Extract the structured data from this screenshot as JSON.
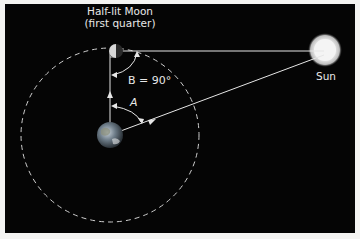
{
  "diagram": {
    "moon_label_line1": "Half-lit Moon",
    "moon_label_line2": "(first quarter)",
    "sun_label": "Sun",
    "angle_b_label": "B = 90°",
    "angle_a_label": "A",
    "colors": {
      "background": "#050505",
      "lines": "#e6e6e6",
      "orbit": "#cfcfcf",
      "sun": "#f2f2f2",
      "earth": "#5a6a78"
    }
  }
}
